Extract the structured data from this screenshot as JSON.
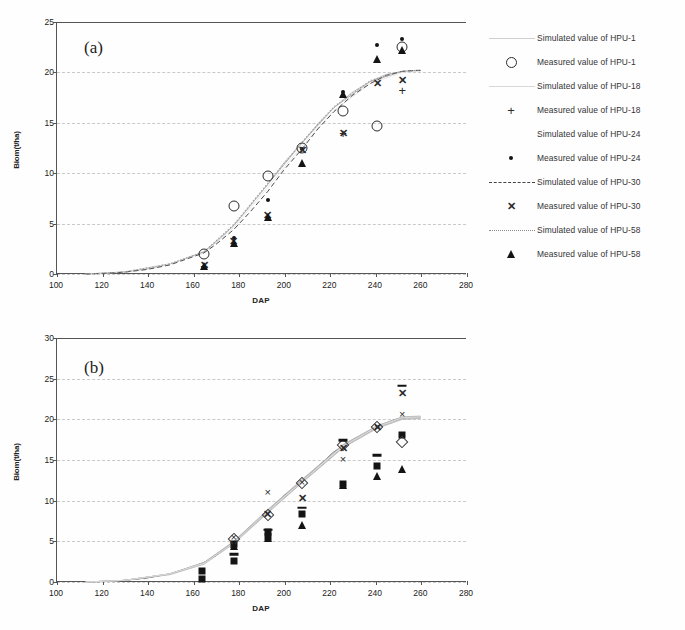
{
  "figure": {
    "panels": [
      {
        "tag": "(a)",
        "xlabel": "DAP",
        "ylabel": "Biom(t/ha)"
      },
      {
        "tag": "(b)",
        "xlabel": "DAP",
        "ylabel": "Biom(t/ha)"
      }
    ]
  },
  "axis_a": {
    "xticks": [
      "100",
      "120",
      "140",
      "160",
      "180",
      "200",
      "220",
      "240",
      "260",
      "280"
    ],
    "yticks": [
      "25",
      "20",
      "15",
      "10",
      "5",
      "0"
    ]
  },
  "axis_b": {
    "xticks": [
      "100",
      "120",
      "140",
      "160",
      "180",
      "200",
      "220",
      "240",
      "260",
      "280"
    ],
    "yticks": [
      "30",
      "25",
      "20",
      "15",
      "10",
      "5",
      "0"
    ]
  },
  "legend_a": [
    {
      "label": "Simulated value of HPU-1",
      "key": "line-faint"
    },
    {
      "label": "Measured value of HPU-1",
      "key": "circle"
    },
    {
      "label": "Simulated value of HPU-18",
      "key": "line-faint2"
    },
    {
      "label": "Measured value of HPU-18",
      "key": "plus"
    },
    {
      "label": "Simulated value of HPU-24",
      "key": "line-none"
    },
    {
      "label": "Measured value of HPU-24",
      "key": "dot"
    },
    {
      "label": "Simulated value of HPU-30",
      "key": "line-dashed"
    },
    {
      "label": "Measured value of HPU-30",
      "key": "exbold"
    },
    {
      "label": "Simulated value of HPU-58",
      "key": "line-dotted"
    },
    {
      "label": "Measured value of HPU-58",
      "key": "triangle"
    }
  ],
  "legend_b": [
    {
      "label": "Simulated value of HPU-68",
      "key": "line-solid"
    },
    {
      "label": "Measured value of HPU-68",
      "key": "square"
    },
    {
      "label": "Simulated value of HPU-82",
      "key": "line-none"
    },
    {
      "label": "Measured value of HPU-82",
      "key": "diamond"
    },
    {
      "label": "Simulated value of HPU-99",
      "key": "line-faint"
    },
    {
      "label": "Measured value of HPU-99",
      "key": "ex"
    },
    {
      "label": "Simulated value of HPU-100",
      "key": "line-faint2"
    },
    {
      "label": "Measured value of HPU-100",
      "key": "exbold"
    },
    {
      "label": "Simulated value of HPU-104",
      "key": "line-faint"
    },
    {
      "label": "Measured value of HPU-104",
      "key": "triangle"
    },
    {
      "label": "Simulated value of HPU-115",
      "key": "line-faint2"
    },
    {
      "label": "Measured value of HPU-115",
      "key": "dash"
    },
    {
      "label": "Simulated value of HPU-118",
      "key": "line-none"
    }
  ],
  "chart_data": [
    {
      "type": "scatter",
      "panel": "(a)",
      "title": "",
      "xlabel": "DAP",
      "ylabel": "Biom(t/ha)",
      "xlim": [
        100,
        280
      ],
      "ylim": [
        0,
        25
      ],
      "xticks": [
        100,
        120,
        140,
        160,
        180,
        200,
        220,
        240,
        260,
        280
      ],
      "yticks": [
        0,
        5,
        10,
        15,
        20,
        25
      ],
      "grid": "horizontal-dashed",
      "legend_position": "right",
      "simulated": [
        {
          "name": "Simulated value of HPU-1",
          "style": "solid-faint",
          "x": [
            113,
            120,
            130,
            140,
            150,
            160,
            165,
            170,
            178,
            185,
            193,
            200,
            208,
            215,
            222,
            230,
            238,
            245,
            252,
            258,
            260
          ],
          "y": [
            0.0,
            0.05,
            0.2,
            0.5,
            1.0,
            1.8,
            2.2,
            3.1,
            4.8,
            6.7,
            8.9,
            11.0,
            13.0,
            14.9,
            16.5,
            18.0,
            19.1,
            19.8,
            20.1,
            20.2,
            20.2
          ]
        },
        {
          "name": "Simulated value of HPU-18",
          "style": "solid-faint",
          "x": [
            113,
            130,
            150,
            165,
            178,
            193,
            208,
            222,
            238,
            252,
            260
          ],
          "y": [
            0.0,
            0.2,
            1.0,
            2.2,
            4.8,
            8.9,
            13.0,
            16.5,
            19.1,
            20.1,
            20.2
          ]
        },
        {
          "name": "Simulated value of HPU-24",
          "style": "none",
          "x": [
            113,
            130,
            150,
            165,
            178,
            193,
            208,
            222,
            238,
            252,
            260
          ],
          "y": [
            0.0,
            0.2,
            1.0,
            2.1,
            4.6,
            8.6,
            12.7,
            16.2,
            18.9,
            20.0,
            20.1
          ]
        },
        {
          "name": "Simulated value of HPU-30",
          "style": "dashed",
          "x": [
            113,
            120,
            130,
            140,
            150,
            160,
            165,
            170,
            178,
            185,
            193,
            200,
            208,
            215,
            222,
            230,
            238,
            245,
            252,
            258,
            260
          ],
          "y": [
            0.0,
            0.05,
            0.18,
            0.45,
            0.9,
            1.7,
            2.1,
            2.9,
            4.4,
            6.1,
            8.2,
            10.3,
            12.4,
            14.4,
            16.1,
            17.7,
            18.9,
            19.7,
            20.1,
            20.2,
            20.2
          ]
        },
        {
          "name": "Simulated value of HPU-58",
          "style": "dotted",
          "x": [
            113,
            130,
            150,
            165,
            178,
            193,
            208,
            222,
            238,
            252,
            260
          ],
          "y": [
            0.0,
            0.2,
            1.0,
            2.2,
            4.9,
            9.0,
            13.1,
            16.6,
            19.2,
            20.1,
            20.2
          ]
        }
      ],
      "measured": [
        {
          "name": "Measured value of HPU-1",
          "marker": "open-circle",
          "x": [
            165,
            178,
            193,
            208,
            226,
            241,
            252
          ],
          "y": [
            2.0,
            6.7,
            9.7,
            12.5,
            16.2,
            14.7,
            22.5
          ]
        },
        {
          "name": "Measured value of HPU-18",
          "marker": "plus",
          "x": [
            165,
            193,
            226,
            252
          ],
          "y": [
            0.8,
            5.7,
            14.0,
            18.3
          ]
        },
        {
          "name": "Measured value of HPU-24",
          "marker": "small-dot",
          "x": [
            178,
            193,
            208,
            226,
            241,
            252
          ],
          "y": [
            3.6,
            7.3,
            12.4,
            18.1,
            22.7,
            23.3
          ]
        },
        {
          "name": "Measured value of HPU-30",
          "marker": "bold-x",
          "x": [
            165,
            178,
            193,
            208,
            226,
            241,
            252
          ],
          "y": [
            0.9,
            3.3,
            5.9,
            12.3,
            14.0,
            18.9,
            19.2
          ]
        },
        {
          "name": "Measured value of HPU-58",
          "marker": "filled-triangle",
          "x": [
            165,
            178,
            193,
            208,
            226,
            241,
            252
          ],
          "y": [
            0.8,
            3.1,
            5.7,
            11.0,
            17.9,
            21.3,
            22.2
          ]
        }
      ]
    },
    {
      "type": "scatter",
      "panel": "(b)",
      "title": "",
      "xlabel": "DAP",
      "ylabel": "Biom(t/ha)",
      "xlim": [
        100,
        280
      ],
      "ylim": [
        0,
        30
      ],
      "xticks": [
        100,
        120,
        140,
        160,
        180,
        200,
        220,
        240,
        260,
        280
      ],
      "yticks": [
        0,
        5,
        10,
        15,
        20,
        25,
        30
      ],
      "grid": "horizontal-dashed",
      "legend_position": "right",
      "simulated": [
        {
          "name": "Simulated value of HPU-68",
          "style": "solid",
          "x": [
            113,
            120,
            130,
            140,
            150,
            160,
            165,
            170,
            178,
            185,
            193,
            200,
            208,
            215,
            222,
            226,
            233,
            241,
            248,
            252,
            258,
            260
          ],
          "y": [
            0.0,
            0.05,
            0.2,
            0.5,
            1.0,
            1.9,
            2.4,
            3.2,
            4.9,
            6.6,
            8.7,
            10.6,
            12.4,
            14.2,
            16.0,
            16.7,
            17.9,
            19.1,
            19.9,
            20.2,
            20.3,
            20.3
          ]
        },
        {
          "name": "Simulated value of HPU-82",
          "style": "none",
          "x": [
            113,
            130,
            150,
            165,
            178,
            193,
            208,
            226,
            241,
            252,
            260
          ],
          "y": [
            0.0,
            0.2,
            1.0,
            2.4,
            4.9,
            8.7,
            12.4,
            16.7,
            19.1,
            20.2,
            20.3
          ]
        },
        {
          "name": "Simulated value of HPU-99",
          "style": "solid-faint",
          "x": [
            113,
            130,
            150,
            165,
            178,
            193,
            208,
            226,
            241,
            252,
            260
          ],
          "y": [
            0.0,
            0.2,
            1.0,
            2.3,
            4.8,
            8.6,
            12.3,
            16.6,
            19.0,
            20.1,
            20.2
          ]
        },
        {
          "name": "Simulated value of HPU-100",
          "style": "solid-faint",
          "x": [
            113,
            130,
            150,
            165,
            178,
            193,
            208,
            226,
            241,
            252,
            260
          ],
          "y": [
            0.0,
            0.2,
            1.0,
            2.4,
            4.9,
            8.8,
            12.5,
            16.8,
            19.2,
            20.2,
            20.3
          ]
        },
        {
          "name": "Simulated value of HPU-104",
          "style": "solid-faint",
          "x": [
            113,
            130,
            150,
            165,
            178,
            193,
            208,
            226,
            241,
            252,
            260
          ],
          "y": [
            0.0,
            0.2,
            0.9,
            2.2,
            4.7,
            8.5,
            12.2,
            16.5,
            18.9,
            20.0,
            20.1
          ]
        },
        {
          "name": "Simulated value of HPU-115",
          "style": "solid-faint",
          "x": [
            113,
            130,
            150,
            165,
            178,
            193,
            208,
            226,
            241,
            252,
            260
          ],
          "y": [
            0.0,
            0.2,
            1.0,
            2.4,
            5.0,
            8.9,
            12.6,
            16.9,
            19.2,
            20.3,
            20.4
          ]
        },
        {
          "name": "Simulated value of HPU-118",
          "style": "none",
          "x": [
            113,
            130,
            150,
            165,
            178,
            193,
            208,
            226,
            241,
            252,
            260
          ],
          "y": [
            0.0,
            0.2,
            1.0,
            2.3,
            4.8,
            8.7,
            12.4,
            16.7,
            19.1,
            20.2,
            20.3
          ]
        }
      ],
      "measured": [
        {
          "name": "Measured value of HPU-68",
          "marker": "filled-square",
          "x": [
            164,
            164,
            178,
            178,
            193,
            193,
            208,
            226,
            241,
            252
          ],
          "y": [
            0.4,
            1.3,
            2.6,
            4.7,
            5.5,
            6.2,
            8.3,
            12.0,
            14.3,
            18.1
          ]
        },
        {
          "name": "Measured value of HPU-82",
          "marker": "open-diamond",
          "x": [
            178,
            193,
            208,
            226,
            241,
            252
          ],
          "y": [
            5.3,
            8.2,
            12.2,
            16.8,
            19.1,
            17.2
          ]
        },
        {
          "name": "Measured value of HPU-99",
          "marker": "x-thin",
          "x": [
            178,
            193,
            208,
            226,
            241,
            252
          ],
          "y": [
            5.5,
            11.1,
            12.3,
            15.1,
            19.1,
            20.7
          ]
        },
        {
          "name": "Measured value of HPU-100",
          "marker": "bold-x",
          "x": [
            178,
            193,
            208,
            226,
            241,
            252
          ],
          "y": [
            4.6,
            8.3,
            10.3,
            16.5,
            19.0,
            23.2
          ]
        },
        {
          "name": "Measured value of HPU-104",
          "marker": "filled-triangle",
          "x": [
            178,
            193,
            208,
            226,
            241,
            252
          ],
          "y": [
            4.4,
            5.4,
            7.0,
            11.9,
            13.0,
            13.9
          ]
        },
        {
          "name": "Measured value of HPU-115",
          "marker": "dash",
          "x": [
            178,
            193,
            208,
            226,
            241,
            252
          ],
          "y": [
            3.4,
            6.4,
            9.1,
            17.4,
            15.6,
            24.1
          ]
        }
      ]
    }
  ]
}
